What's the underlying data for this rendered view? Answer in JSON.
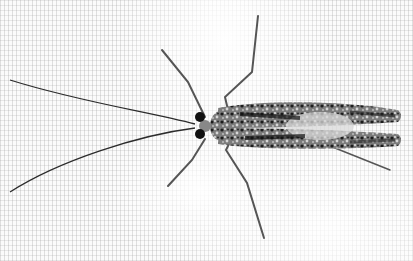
{
  "image": {
    "subject": "Insect with long antennae and mottled black-and-white wings resting on mesh fabric",
    "background": "White woven mesh / net fabric",
    "colors": {
      "background": "#fbfbfb",
      "mesh": "#9a9a9a",
      "insect_dark": "#1a1a1a",
      "insect_light": "#d8d8d8",
      "legs": "#5a5a5a"
    }
  }
}
